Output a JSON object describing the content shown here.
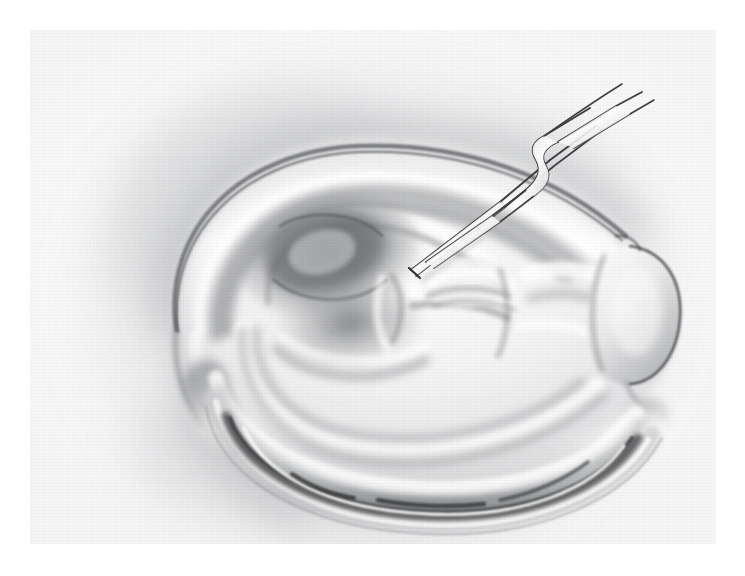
{
  "figure": {
    "domain": "medical-illustration",
    "medium": "graphite pencil drawing on textured paper",
    "caption": "",
    "title": "",
    "label": "",
    "visible_text": [],
    "background_color": "#ffffff",
    "plate_color": "#fafafb",
    "ink_color": "#2b2b2b",
    "shadow_color": "#6f7174",
    "deep_shadow_color": "#3a3b3d",
    "highlight_color": "#ffffff"
  },
  "plate": {
    "x": 30,
    "y": 30,
    "width": 686,
    "height": 514
  },
  "anatomy": {
    "parts": [
      {
        "name": "helix-rim",
        "role": "outer curved rim of the ear"
      },
      {
        "name": "scapha-groove",
        "role": "hollow between helix and antihelix"
      },
      {
        "name": "antihelix-fold",
        "role": "Y shaped inner fold"
      },
      {
        "name": "triangular-fossa",
        "role": "deep dark hollow at upper centre"
      },
      {
        "name": "concha-bowl",
        "role": "central bowl shadow"
      },
      {
        "name": "crus-of-helix",
        "role": "ridge crossing the concha"
      },
      {
        "name": "tragus-prominence",
        "role": "rounded lobe at right"
      },
      {
        "name": "lobule-fold",
        "role": "lower layered fold"
      },
      {
        "name": "post-auricular-sulcus",
        "role": "dark crevice beneath the lower fold"
      }
    ]
  },
  "markings": {
    "excision_circle": {
      "name": "dashed-excision-circle",
      "shape": "ellipse",
      "center_x": 438,
      "center_y": 258,
      "radius_x": 57,
      "radius_y": 44,
      "rotation_deg": -8,
      "stroke": "#232323",
      "stroke_width": 2.6,
      "style": "solid at top arc, dashed along lower arc"
    }
  },
  "instrument": {
    "name": "surgical-forceps",
    "type": "tissue forceps / tweezers",
    "stroke": "#3b3c3e",
    "tip_x": 413,
    "tip_y": 228,
    "handle_x": 600,
    "handle_y": 88,
    "arms": 2
  },
  "chart_data": null
}
